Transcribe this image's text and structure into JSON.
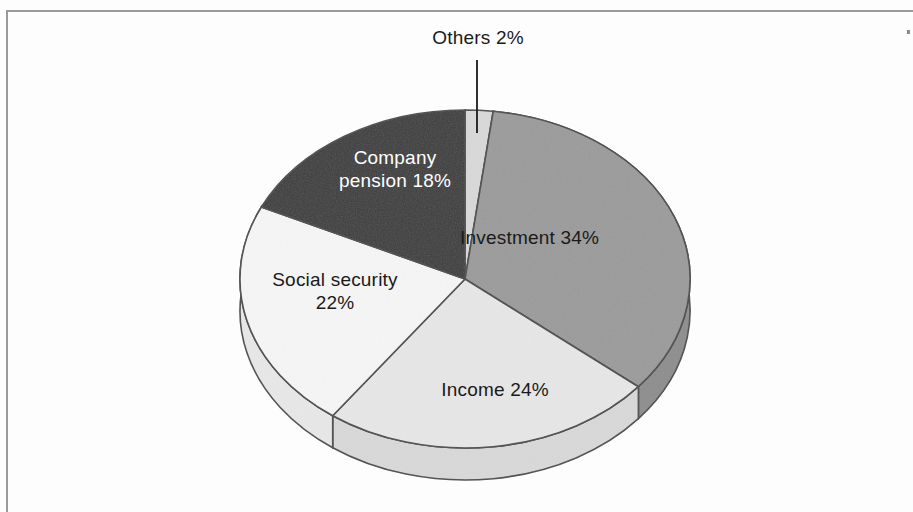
{
  "chart_data": {
    "type": "pie",
    "title": "",
    "subtitle": "",
    "xlabel": "",
    "ylabel": "",
    "legend_position": "none",
    "grid": false,
    "style": "3d-exploded-none",
    "units": "percent",
    "total": 100,
    "start_angle_deg": 0,
    "direction": "clockwise",
    "categories": [
      "Others",
      "Investment",
      "Income",
      "Social security",
      "Company pension"
    ],
    "values": [
      2,
      34,
      24,
      22,
      18
    ],
    "labels": [
      "Others 2%",
      "Investment 34%",
      "Income 24%",
      "Social security 22%",
      "Company pension 18%"
    ],
    "colors": [
      "#d9d9d9",
      "#9b9b9b",
      "#e7e7e7",
      "#f6f6f6",
      "#3c3c3c"
    ],
    "slices": [
      {
        "name": "Others",
        "label": "Others 2%",
        "value": 2,
        "color": "#d9d9d9",
        "label_color": "#1a1a1a",
        "label_placement": "outside-leader-line"
      },
      {
        "name": "Investment",
        "label": "Investment 34%",
        "value": 34,
        "color": "#9b9b9b",
        "label_color": "#1a1a1a",
        "label_placement": "inside"
      },
      {
        "name": "Income",
        "label": "Income 24%",
        "value": 24,
        "color": "#e7e7e7",
        "label_color": "#1a1a1a",
        "label_placement": "inside"
      },
      {
        "name": "Social security",
        "label": "Social security\n22%",
        "value": 22,
        "color": "#f6f6f6",
        "label_color": "#1a1a1a",
        "label_placement": "inside"
      },
      {
        "name": "Company pension",
        "label": "Company\npension 18%",
        "value": 18,
        "color": "#3c3c3c",
        "label_color": "#ffffff",
        "label_placement": "inside"
      }
    ]
  },
  "geometry": {
    "center_x": 465,
    "center_y": 279,
    "radius_x": 225,
    "radius_y": 169,
    "depth": 32,
    "outline_color": "#4a4a4a"
  },
  "frame": {
    "border_color": "#9a9a9a",
    "background": "#fdfdfd"
  },
  "bleed_through": {
    "line1": "vet se",
    "line2": "he ner",
    "line3": "te are",
    "line4": "ete"
  }
}
